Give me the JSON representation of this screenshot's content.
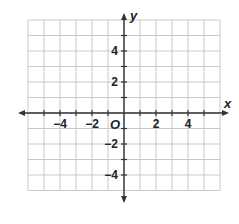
{
  "chart_data": {
    "type": "coordinate-plane",
    "title": "",
    "xlabel": "x",
    "ylabel": "y",
    "origin_label": "O",
    "xlim": [
      -6,
      6
    ],
    "ylim": [
      -5,
      6
    ],
    "grid": true,
    "x_tick_labels": [
      {
        "value": -4,
        "label": "−4"
      },
      {
        "value": -2,
        "label": "−2"
      },
      {
        "value": 2,
        "label": "2"
      },
      {
        "value": 4,
        "label": "4"
      }
    ],
    "y_tick_labels": [
      {
        "value": 4,
        "label": "4"
      },
      {
        "value": 2,
        "label": "2"
      },
      {
        "value": -2,
        "label": "−2"
      },
      {
        "value": -4,
        "label": "−4"
      }
    ],
    "colors": {
      "grid": "#c8c8c8",
      "axis": "#333333",
      "text": "#222222"
    }
  }
}
